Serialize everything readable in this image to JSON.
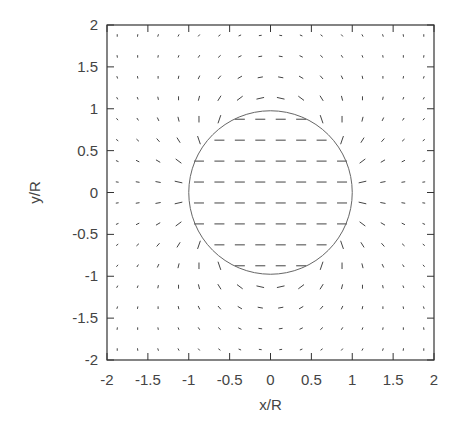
{
  "chart_data": {
    "type": "vector_field",
    "title": "",
    "xlabel": "x/R",
    "ylabel": "y/R",
    "xlim": [
      -2,
      2
    ],
    "ylim": [
      -2,
      2
    ],
    "xticks": [
      "-2",
      "-1.5",
      "-1",
      "-0.5",
      "0",
      "0.5",
      "1",
      "1.5",
      "2"
    ],
    "yticks": [
      "-2",
      "-1.5",
      "-1",
      "-0.5",
      "0",
      "0.5",
      "1",
      "1.5",
      "2"
    ],
    "grid": false,
    "legend": null,
    "annotations": [
      {
        "type": "circle",
        "center": [
          0,
          0
        ],
        "radius": 1,
        "label": ""
      }
    ],
    "field": {
      "grid_x_start": -1.875,
      "grid_x_step": 0.25,
      "grid_x_count": 16,
      "grid_y_start": -1.875,
      "grid_y_step": 0.25,
      "grid_y_count": 16,
      "description": "Uniform flow in +x inside circle of radius R; dipole-like flow outside"
    }
  },
  "colors": {
    "axis": "#333333",
    "arrow": "#444444",
    "circle": "#666666",
    "background": "#ffffff"
  }
}
